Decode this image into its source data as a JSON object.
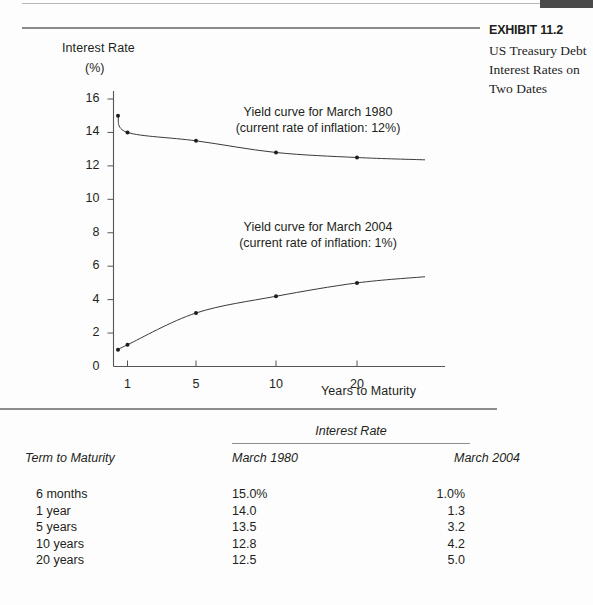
{
  "exhibit": {
    "number": "EXHIBIT 11.2",
    "description": "US Treasury Debt Interest Rates on Two Dates"
  },
  "chart_data": {
    "type": "line",
    "title": "",
    "ylabel": "Interest Rate",
    "ylabel_unit": "(%)",
    "xlabel": "Years to Maturity",
    "x": [
      0.5,
      1,
      5,
      10,
      20
    ],
    "xticks": [
      1,
      5,
      10,
      20
    ],
    "xtick_labels": [
      "1",
      "5",
      "10",
      "20"
    ],
    "yticks": [
      0,
      2,
      4,
      6,
      8,
      10,
      12,
      14,
      16
    ],
    "ytick_labels": [
      "0",
      "2",
      "4",
      "6",
      "8",
      "10",
      "12",
      "14",
      "16"
    ],
    "ylim": [
      0,
      16
    ],
    "grid": false,
    "legend_position": "annotations",
    "series": [
      {
        "name": "March 1980",
        "values": [
          15.0,
          14.0,
          13.5,
          12.8,
          12.5
        ],
        "annotation_line1": "Yield curve for March 1980",
        "annotation_line2": "(current rate of inflation: 12%)"
      },
      {
        "name": "March 2004",
        "values": [
          1.0,
          1.3,
          3.2,
          4.2,
          5.0
        ],
        "annotation_line1": "Yield curve for March 2004",
        "annotation_line2": "(current rate of inflation: 1%)"
      }
    ]
  },
  "table": {
    "group_header": "Interest Rate",
    "columns": [
      "Term to Maturity",
      "March 1980",
      "March 2004"
    ],
    "rows": [
      {
        "term": "6 months",
        "r1980": "15.0%",
        "r2004": "1.0%"
      },
      {
        "term": "1 year",
        "r1980": "14.0",
        "r2004": "1.3"
      },
      {
        "term": "5 years",
        "r1980": "13.5",
        "r2004": "3.2"
      },
      {
        "term": "10 years",
        "r1980": "12.8",
        "r2004": "4.2"
      },
      {
        "term": "20 years",
        "r1980": "12.5",
        "r2004": "5.0"
      }
    ]
  },
  "colors": {
    "ink": "#231f20",
    "rule": "#8d8d8d",
    "hairline": "#b9b9b9",
    "corner_block": "#4a4a4a",
    "page": "#fdfdfd"
  }
}
